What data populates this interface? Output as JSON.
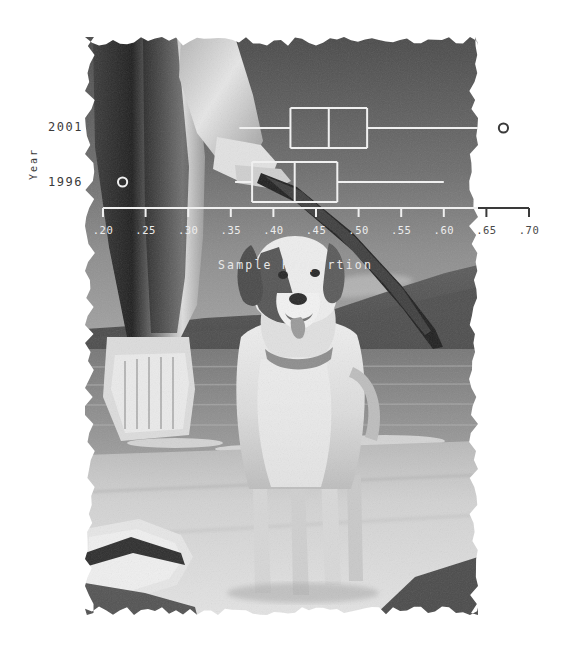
{
  "figure": {
    "kind": "statistical-graphic-over-photograph",
    "background_color": "#ffffff",
    "ink_color_on_photo": "#f0f0f0",
    "ink_color_on_white": "#3a3a3a"
  },
  "photo": {
    "description": "Black and white photograph of a light coloured labrador retriever dog standing on a sandy beach, a person's legs and hand holding a stick at upper left, lake water and low hills behind",
    "torn_edges": true,
    "left": 85,
    "top": 37,
    "width": 393,
    "height": 578
  },
  "chart_data": {
    "type": "box",
    "title": "",
    "xlabel": "Sample Proportion",
    "ylabel": "Year",
    "orientation": "horizontal",
    "xlim": [
      0.18,
      0.72
    ],
    "xticks": [
      0.2,
      0.25,
      0.3,
      0.35,
      0.4,
      0.45,
      0.5,
      0.55,
      0.6,
      0.65,
      0.7
    ],
    "xticklabels": [
      ".20",
      ".25",
      ".30",
      ".35",
      ".40",
      ".45",
      ".50",
      ".55",
      ".60",
      ".65",
      ".70"
    ],
    "grid": false,
    "legend": null,
    "categories": [
      "2001",
      "1996"
    ],
    "boxes": [
      {
        "category": "2001",
        "min": 0.36,
        "q1": 0.42,
        "median": 0.465,
        "q3": 0.51,
        "max": 0.64,
        "outliers": [
          0.67
        ]
      },
      {
        "category": "1996",
        "min": 0.355,
        "q1": 0.375,
        "median": 0.425,
        "q3": 0.475,
        "max": 0.6,
        "outliers": [
          0.223
        ]
      }
    ]
  },
  "axis": {
    "y_axis_title": "Year",
    "y_categories": [
      {
        "label": "2001"
      },
      {
        "label": "1996"
      }
    ],
    "x_axis_title": "Sample Proportion",
    "x_tick_labels": [
      ".20",
      ".25",
      ".30",
      ".35",
      ".40",
      ".45",
      ".50",
      ".55",
      ".60",
      ".65",
      ".70"
    ]
  }
}
